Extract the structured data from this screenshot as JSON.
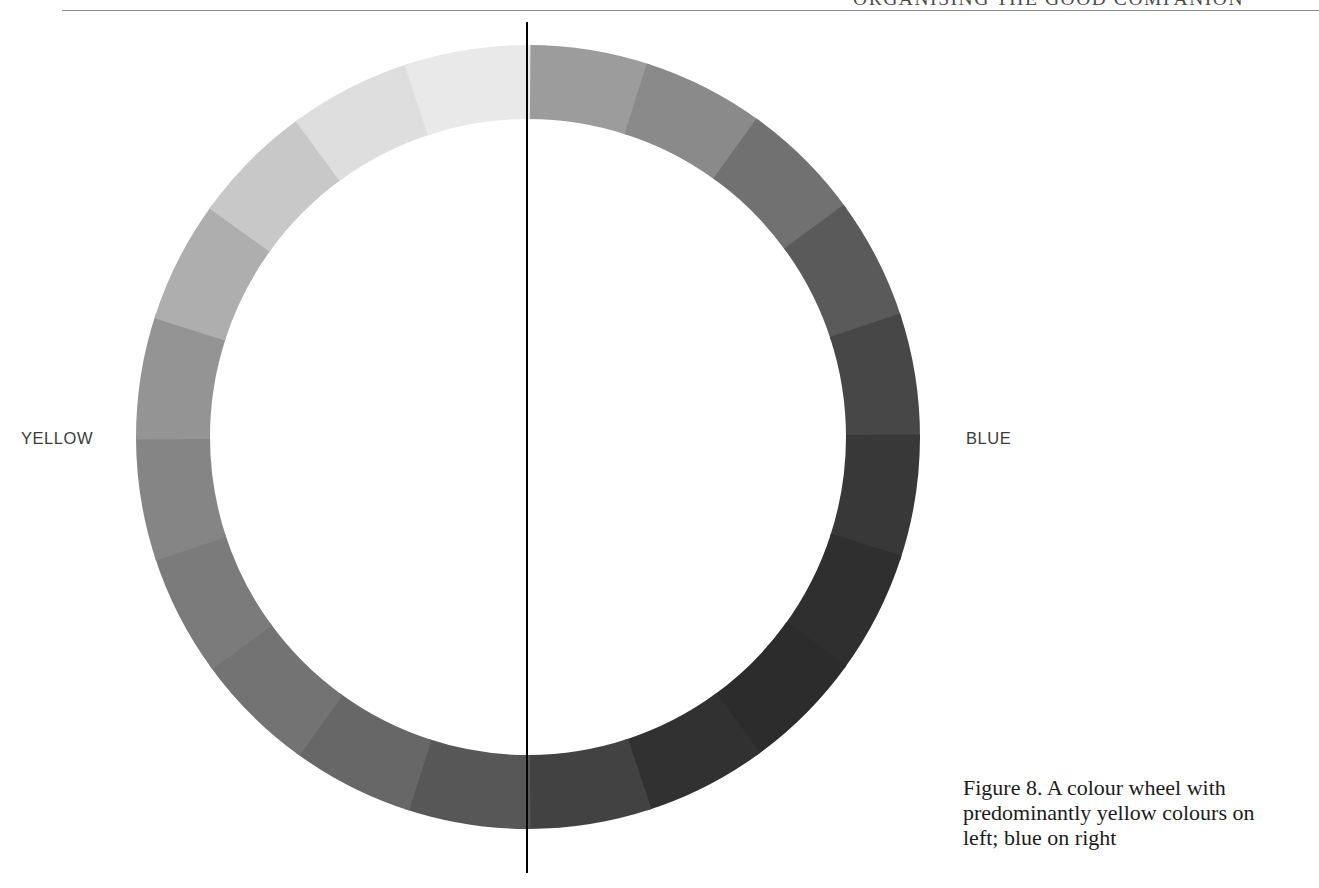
{
  "page": {
    "running_head": "ORGANISING THE GOOD COMPANION",
    "background_color": "#ffffff",
    "rule_color": "#8d8d8d"
  },
  "figure": {
    "caption": "Figure 8. A colour wheel with predominantly yellow colours on left; blue on right",
    "caption_lines": [
      "Figure 8. A colour wheel with",
      "predominantly yellow colours on",
      "left; blue on right"
    ],
    "labels": {
      "left": "YELLOW",
      "right": "BLUE"
    },
    "divider_line_color": "#000000"
  },
  "chart_data": {
    "type": "pie",
    "title": "A colour wheel with predominantly yellow colours on left; blue on right",
    "subtitle": "",
    "xlabel": "",
    "ylabel": "",
    "legend_position": "sides",
    "grid": false,
    "shape": "annulus",
    "center_x": 528,
    "center_y": 437,
    "outer_radius": 392,
    "inner_radius": 318,
    "segment_count": 20,
    "segment_degrees": 18,
    "start_angle_deg": -90,
    "annotations": [
      {
        "text": "YELLOW",
        "side": "left",
        "x": 21,
        "y": 437
      },
      {
        "text": "BLUE",
        "side": "right",
        "x": 966,
        "y": 437
      }
    ],
    "divider": {
      "orientation": "vertical",
      "x": 527,
      "y_top": 22,
      "y_bottom": 873,
      "color": "#000000",
      "width": 2
    },
    "categories": [
      "seg-00",
      "seg-01",
      "seg-02",
      "seg-03",
      "seg-04",
      "seg-05",
      "seg-06",
      "seg-07",
      "seg-08",
      "seg-09",
      "seg-10",
      "seg-11",
      "seg-12",
      "seg-13",
      "seg-14",
      "seg-15",
      "seg-16",
      "seg-17",
      "seg-18",
      "seg-19"
    ],
    "values": [
      5,
      5,
      5,
      5,
      5,
      5,
      5,
      5,
      5,
      5,
      5,
      5,
      5,
      5,
      5,
      5,
      5,
      5,
      5,
      5
    ],
    "series": [
      {
        "name": "segment lightness (0-100)",
        "values": [
          58,
          51,
          42,
          33,
          26,
          20,
          17,
          16,
          18,
          24,
          32,
          38,
          43,
          46,
          50,
          56,
          66,
          76,
          85,
          90
        ]
      }
    ],
    "colors": [
      "#9c9c9c",
      "#8a8a8a",
      "#717171",
      "#5a5a5a",
      "#474747",
      "#383838",
      "#2f2f2f",
      "#2c2c2c",
      "#313131",
      "#424242",
      "#575757",
      "#676767",
      "#737373",
      "#7b7b7b",
      "#858585",
      "#949494",
      "#aeaeae",
      "#c8c8c8",
      "#dedede",
      "#e9e9e9"
    ],
    "color_notes": "desaturated/greyscale reproduction: lightest yellow tints at upper-left, darkest blue shades at right"
  }
}
